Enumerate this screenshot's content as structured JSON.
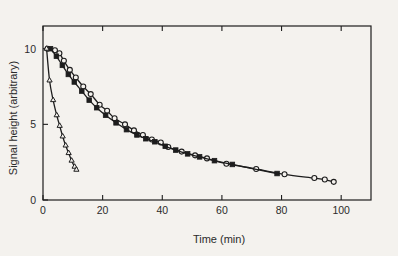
{
  "figure": {
    "background_color": "#f4f2ee",
    "ink_color": "#1d1d1d"
  },
  "chart_data": {
    "type": "scatter",
    "title": "",
    "xlabel": "Time (min)",
    "ylabel": "Signal height (arbitrary)",
    "xlim": [
      0,
      110
    ],
    "ylim": [
      0,
      11.5
    ],
    "xticks": [
      0,
      20,
      40,
      60,
      80,
      100
    ],
    "xtick_labels": [
      "0",
      "20",
      "40",
      "60",
      "80",
      "100"
    ],
    "yticks": [
      0,
      5,
      10
    ],
    "ytick_labels": [
      "0",
      "5",
      "10"
    ],
    "grid": false,
    "legend": "none",
    "frame": "box",
    "tick_direction": "in",
    "series": [
      {
        "name": "open-circle-series",
        "marker": "circle-open",
        "points": [
          [
            1.5,
            10.0
          ],
          [
            4.0,
            9.9
          ],
          [
            5.5,
            9.7
          ],
          [
            7.0,
            9.2
          ],
          [
            9.0,
            8.6
          ],
          [
            11.0,
            8.1
          ],
          [
            13.5,
            7.5
          ],
          [
            16.0,
            7.0
          ],
          [
            19.0,
            6.3
          ],
          [
            21.5,
            5.9
          ],
          [
            24.0,
            5.4
          ],
          [
            27.5,
            5.0
          ],
          [
            30.5,
            4.6
          ],
          [
            33.5,
            4.3
          ],
          [
            36.5,
            4.0
          ],
          [
            39.5,
            3.8
          ],
          [
            42.0,
            3.5
          ],
          [
            46.5,
            3.2
          ],
          [
            51.0,
            2.95
          ],
          [
            55.0,
            2.75
          ],
          [
            61.5,
            2.4
          ],
          [
            71.5,
            2.05
          ],
          [
            81.0,
            1.7
          ],
          [
            91.0,
            1.45
          ],
          [
            94.5,
            1.35
          ],
          [
            97.5,
            1.2
          ]
        ]
      },
      {
        "name": "filled-square-series",
        "marker": "square-filled",
        "points": [
          [
            2.5,
            10.0
          ],
          [
            4.5,
            9.5
          ],
          [
            6.5,
            8.9
          ],
          [
            8.5,
            8.3
          ],
          [
            10.5,
            7.8
          ],
          [
            13.0,
            7.2
          ],
          [
            15.5,
            6.6
          ],
          [
            18.0,
            6.1
          ],
          [
            21.0,
            5.6
          ],
          [
            24.5,
            5.1
          ],
          [
            28.0,
            4.65
          ],
          [
            31.5,
            4.3
          ],
          [
            34.5,
            4.05
          ],
          [
            37.5,
            3.85
          ],
          [
            41.0,
            3.55
          ],
          [
            44.5,
            3.3
          ],
          [
            48.5,
            3.05
          ],
          [
            52.5,
            2.85
          ],
          [
            57.5,
            2.6
          ],
          [
            63.5,
            2.35
          ],
          [
            78.5,
            1.75
          ]
        ]
      },
      {
        "name": "open-triangle-series",
        "marker": "triangle-open",
        "points": [
          [
            1.2,
            10.0
          ],
          [
            2.2,
            7.9
          ],
          [
            3.4,
            6.6
          ],
          [
            4.6,
            5.6
          ],
          [
            5.6,
            4.9
          ],
          [
            6.6,
            4.2
          ],
          [
            7.6,
            3.6
          ],
          [
            8.6,
            3.1
          ],
          [
            9.6,
            2.6
          ],
          [
            10.6,
            2.2
          ],
          [
            11.2,
            2.0
          ]
        ]
      }
    ]
  }
}
